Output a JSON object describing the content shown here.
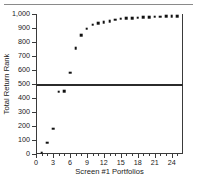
{
  "chart_data": {
    "type": "scatter",
    "title": "",
    "xlabel": "Screen #1 Portfolios",
    "ylabel": "Total Return Rank",
    "xlim": [
      0,
      26
    ],
    "ylim": [
      0,
      1000
    ],
    "grid": false,
    "legend": null,
    "xticks": [
      0,
      3,
      6,
      9,
      12,
      15,
      18,
      21,
      24
    ],
    "xtick_labels": [
      "0",
      "3",
      "6",
      "9",
      "12",
      "15",
      "18",
      "21",
      "24"
    ],
    "xticks_minor": [
      1,
      2,
      4,
      5,
      7,
      8,
      10,
      11,
      13,
      14,
      16,
      17,
      19,
      20,
      22,
      23,
      25
    ],
    "yticks": [
      0,
      100,
      200,
      300,
      400,
      500,
      600,
      700,
      800,
      900,
      1000
    ],
    "ytick_labels": [
      "0",
      "100",
      "200",
      "300",
      "400",
      "500",
      "600",
      "700",
      "800",
      "900",
      "1,000"
    ],
    "reference_line": {
      "orientation": "horizontal",
      "value": 500,
      "color": "#2b2b2b"
    },
    "marker": {
      "shape": "square",
      "color": "#111111",
      "size_px": 2.6
    },
    "x": [
      1,
      2,
      3,
      4,
      5,
      6,
      7,
      8,
      9,
      10,
      11,
      12,
      13,
      14,
      15,
      16,
      17,
      18,
      19,
      20,
      21,
      22,
      23,
      24,
      25
    ],
    "y": [
      10,
      80,
      180,
      445,
      450,
      580,
      755,
      850,
      895,
      925,
      935,
      940,
      950,
      960,
      965,
      970,
      972,
      974,
      976,
      978,
      980,
      982,
      983,
      984,
      985
    ],
    "points": [
      {
        "x": 1,
        "y": 10
      },
      {
        "x": 2,
        "y": 80
      },
      {
        "x": 3,
        "y": 180
      },
      {
        "x": 4,
        "y": 445
      },
      {
        "x": 5,
        "y": 450
      },
      {
        "x": 6,
        "y": 580
      },
      {
        "x": 7,
        "y": 755
      },
      {
        "x": 8,
        "y": 850
      },
      {
        "x": 9,
        "y": 895
      },
      {
        "x": 10,
        "y": 925
      },
      {
        "x": 11,
        "y": 935
      },
      {
        "x": 12,
        "y": 940
      },
      {
        "x": 13,
        "y": 950
      },
      {
        "x": 14,
        "y": 960
      },
      {
        "x": 15,
        "y": 965
      },
      {
        "x": 16,
        "y": 970
      },
      {
        "x": 17,
        "y": 972
      },
      {
        "x": 18,
        "y": 974
      },
      {
        "x": 19,
        "y": 976
      },
      {
        "x": 20,
        "y": 978
      },
      {
        "x": 21,
        "y": 980
      },
      {
        "x": 22,
        "y": 982
      },
      {
        "x": 23,
        "y": 983
      },
      {
        "x": 24,
        "y": 984
      },
      {
        "x": 25,
        "y": 985
      }
    ]
  }
}
